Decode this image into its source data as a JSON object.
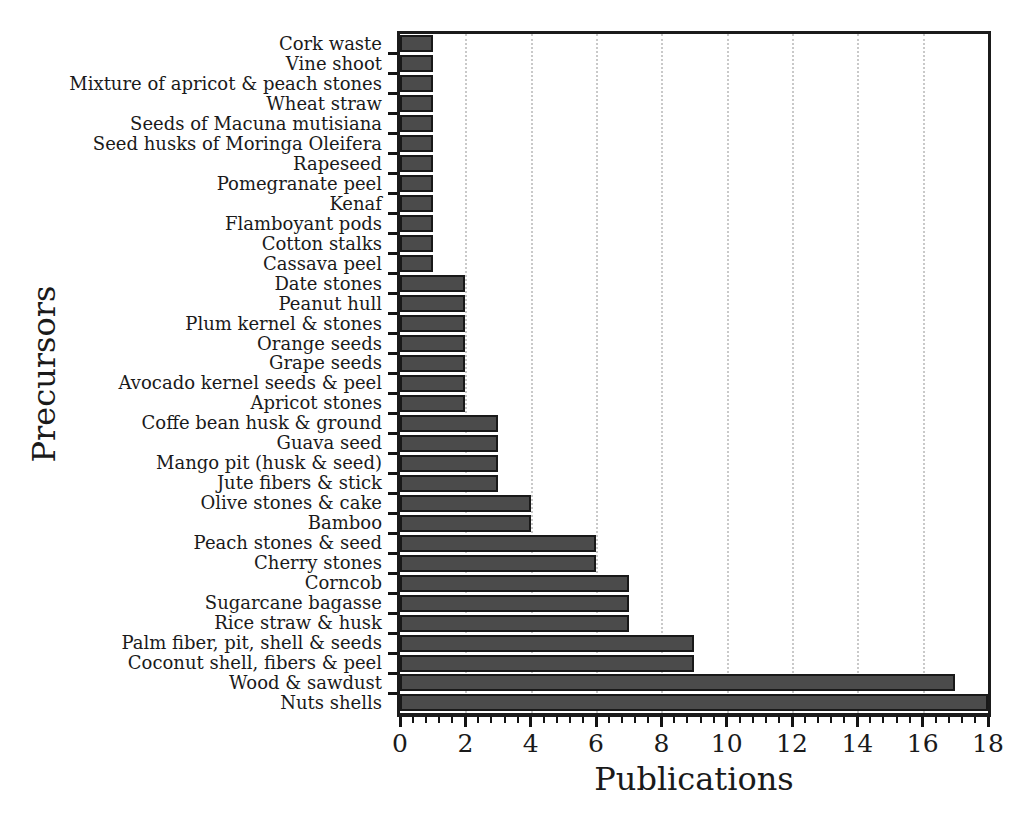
{
  "figure": {
    "background": "#ffffff",
    "frame_color": "#1b1b1b",
    "gridline_color": "#c9c9c9"
  },
  "chart_data": {
    "type": "bar",
    "orientation": "horizontal",
    "title": "",
    "xlabel": "Publications",
    "ylabel": "Precursors",
    "xlim": [
      0,
      18
    ],
    "xticks": [
      0,
      2,
      4,
      6,
      8,
      10,
      12,
      14,
      16,
      18
    ],
    "minor_tick_interval": 0.4,
    "grid": "vertical dotted lines at major x ticks",
    "legend": "none",
    "bar_color": "#4b4b4b",
    "bar_border_color": "#191919",
    "categories": [
      "Cork waste",
      "Vine shoot",
      "Mixture of apricot & peach stones",
      "Wheat straw",
      "Seeds of Macuna mutisiana",
      "Seed husks of Moringa Oleifera",
      "Rapeseed",
      "Pomegranate peel",
      "Kenaf",
      "Flamboyant pods",
      "Cotton stalks",
      "Cassava peel",
      "Date stones",
      "Peanut hull",
      "Plum kernel & stones",
      "Orange seeds",
      "Grape seeds",
      "Avocado kernel seeds & peel",
      "Apricot stones",
      "Coffe bean husk & ground",
      "Guava seed",
      "Mango pit (husk & seed)",
      "Jute fibers & stick",
      "Olive stones & cake",
      "Bamboo",
      "Peach stones & seed",
      "Cherry stones",
      "Corncob",
      "Sugarcane bagasse",
      "Rice straw & husk",
      "Palm fiber, pit, shell & seeds",
      "Coconut shell, fibers & peel",
      "Wood & sawdust",
      "Nuts shells"
    ],
    "values": [
      1,
      1,
      1,
      1,
      1,
      1,
      1,
      1,
      1,
      1,
      1,
      1,
      2,
      2,
      2,
      2,
      2,
      2,
      2,
      3,
      3,
      3,
      3,
      4,
      4,
      6,
      6,
      7,
      7,
      7,
      9,
      9,
      17,
      18
    ]
  }
}
